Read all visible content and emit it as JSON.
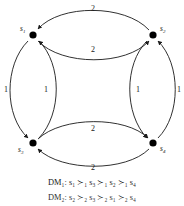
{
  "diagram": {
    "type": "directed-graph",
    "nodes": [
      {
        "id": "s1",
        "label": "s",
        "sub": "1",
        "x": 33,
        "y": 35,
        "label_x": 20,
        "label_y": 31
      },
      {
        "id": "s2",
        "label": "s",
        "sub": "2",
        "x": 153,
        "y": 35,
        "label_x": 160,
        "label_y": 31
      },
      {
        "id": "s3",
        "label": "s",
        "sub": "3",
        "x": 33,
        "y": 143,
        "label_x": 18,
        "label_y": 152
      },
      {
        "id": "s4",
        "label": "s",
        "sub": "4",
        "x": 153,
        "y": 143,
        "label_x": 160,
        "label_y": 151
      }
    ],
    "edge_weights": [
      {
        "id": "top-outer",
        "value": "2",
        "x": 93,
        "y": 11
      },
      {
        "id": "top-inner",
        "value": "2",
        "x": 93,
        "y": 52
      },
      {
        "id": "left-outer",
        "value": "1",
        "x": 6,
        "y": 92
      },
      {
        "id": "left-inner",
        "value": "1",
        "x": 46,
        "y": 92
      },
      {
        "id": "right-inner",
        "value": "1",
        "x": 138,
        "y": 92
      },
      {
        "id": "right-outer",
        "value": "1",
        "x": 179,
        "y": 92
      },
      {
        "id": "bottom-inner",
        "value": "2",
        "x": 93,
        "y": 131
      },
      {
        "id": "bottom-outer",
        "value": "2",
        "x": 93,
        "y": 170
      }
    ]
  },
  "captions": {
    "line1": "DM₁: s₁ ≻₁ s₃ ≻₁ s₂ ≻₁ s₄",
    "line2": "DM₂: s₂ ≻₂ s₃ ≻₂ s₁ ≻₂ s₄"
  },
  "colors": {
    "stroke": "#1a1a1a",
    "node": "#000000",
    "background": "#ffffff"
  }
}
